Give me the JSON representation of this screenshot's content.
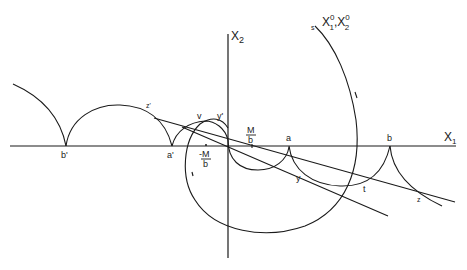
{
  "diagram": {
    "axes": {
      "x_label": "X",
      "x_sub": "1",
      "y_label": "X",
      "y_sub": "2"
    },
    "start_point": {
      "marker": "s",
      "label_x": "X",
      "label_x_sup": "0",
      "label_x_sub": "1",
      "separator": ",",
      "label_y": "X",
      "label_y_sup": "0",
      "label_y_sub": "2"
    },
    "points": {
      "b_prime": "b'",
      "a_prime": "a'",
      "minus_M_over_b_num": "-M",
      "minus_M_over_b_den": "b",
      "M_over_b_num": "M",
      "M_over_b_den": "b",
      "a": "a",
      "b": "b",
      "v": "v",
      "y_prime": "y'",
      "z_prime": "z'",
      "y": "y",
      "t": "t",
      "z": "z"
    },
    "colors": {
      "stroke": "#1a1a1a",
      "background": "#ffffff"
    }
  }
}
